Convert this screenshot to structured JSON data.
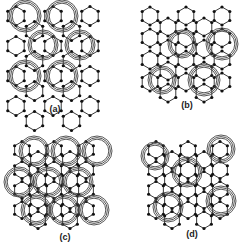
{
  "figure": {
    "background": "#ffffff",
    "line_color": "#222222",
    "node_color": "#111111",
    "ring_color": "#444444"
  },
  "panels": [
    {
      "id": "a",
      "label": "(a)",
      "label_pos": [
        55,
        104
      ],
      "hex_size": 9.5,
      "lattice": {
        "origin": [
          16,
          16
        ],
        "cols": 5,
        "rows": 4,
        "spacing_x": 18.5,
        "spacing_y": 30
      },
      "rings": [
        {
          "cx": 25,
          "cy": 16,
          "r": 16
        },
        {
          "cx": 62,
          "cy": 16,
          "r": 16
        },
        {
          "cx": 43,
          "cy": 45,
          "r": 15
        },
        {
          "cx": 80,
          "cy": 45,
          "r": 15
        },
        {
          "cx": 25,
          "cy": 76,
          "r": 16
        },
        {
          "cx": 62,
          "cy": 76,
          "r": 16
        }
      ]
    },
    {
      "id": "b",
      "label": "(b)",
      "label_pos": [
        187,
        100
      ],
      "hex_size": 9,
      "lattice": {
        "origin": [
          150,
          16
        ],
        "cols": 5,
        "rows": 4,
        "spacing_x": 18,
        "spacing_y": 22
      },
      "rings": [
        {
          "cx": 182,
          "cy": 44,
          "r": 14
        },
        {
          "cx": 222,
          "cy": 44,
          "r": 16
        },
        {
          "cx": 162,
          "cy": 80,
          "r": 14
        },
        {
          "cx": 204,
          "cy": 80,
          "r": 16
        }
      ]
    },
    {
      "id": "c",
      "label": "(c)",
      "label_pos": [
        65,
        232
      ],
      "hex_size": 8.5,
      "lattice": {
        "origin": [
          22,
          150
        ],
        "cols": 5,
        "rows": 4,
        "spacing_x": 16,
        "spacing_y": 20
      },
      "rings": [
        {
          "cx": 34,
          "cy": 151,
          "r": 15
        },
        {
          "cx": 66,
          "cy": 151,
          "r": 15
        },
        {
          "cx": 97,
          "cy": 151,
          "r": 15
        },
        {
          "cx": 19,
          "cy": 182,
          "r": 15
        },
        {
          "cx": 48,
          "cy": 182,
          "r": 15
        },
        {
          "cx": 78,
          "cy": 182,
          "r": 15
        },
        {
          "cx": 36,
          "cy": 210,
          "r": 15
        },
        {
          "cx": 64,
          "cy": 210,
          "r": 15
        },
        {
          "cx": 94,
          "cy": 210,
          "r": 15
        }
      ]
    },
    {
      "id": "d",
      "label": "(d)",
      "label_pos": [
        192,
        229
      ],
      "hex_size": 8.5,
      "lattice": {
        "origin": [
          156,
          150
        ],
        "cols": 5,
        "rows": 4,
        "spacing_x": 16,
        "spacing_y": 20
      },
      "rings": [
        {
          "cx": 155,
          "cy": 156,
          "r": 14
        },
        {
          "cx": 187,
          "cy": 172,
          "r": 15
        },
        {
          "cx": 221,
          "cy": 149,
          "r": 14
        },
        {
          "cx": 221,
          "cy": 201,
          "r": 15
        },
        {
          "cx": 168,
          "cy": 207,
          "r": 15
        }
      ]
    }
  ]
}
